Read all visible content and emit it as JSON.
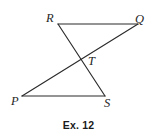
{
  "figure": {
    "caption": "Ex. 12",
    "stroke_color": "#2b2b2b",
    "label_color": "#1f1f1f",
    "background_color": "#ffffff",
    "points": {
      "R": {
        "label": "R",
        "x": 58,
        "y": 24
      },
      "Q": {
        "label": "Q",
        "x": 138,
        "y": 24
      },
      "T": {
        "label": "T",
        "x": 79,
        "y": 61
      },
      "P": {
        "label": "P",
        "x": 22,
        "y": 96
      },
      "S": {
        "label": "S",
        "x": 105,
        "y": 96
      }
    },
    "segments": [
      {
        "name": "RQ",
        "from": "R",
        "to": "Q",
        "x1": 58,
        "y1": 24,
        "x2": 138,
        "y2": 24
      },
      {
        "name": "RS",
        "from": "R",
        "to": "S",
        "x1": 58,
        "y1": 24,
        "x2": 105,
        "y2": 96
      },
      {
        "name": "PQ",
        "from": "P",
        "to": "Q",
        "x1": 22,
        "y1": 96,
        "x2": 138,
        "y2": 24
      },
      {
        "name": "PS",
        "from": "P",
        "to": "S",
        "x1": 22,
        "y1": 96,
        "x2": 105,
        "y2": 96
      }
    ]
  }
}
